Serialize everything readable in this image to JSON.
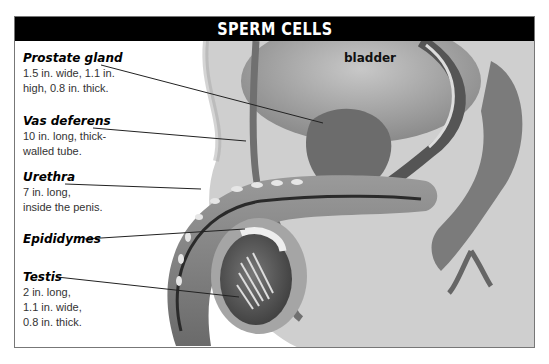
{
  "title": "SPERM CELLS",
  "organ_label": "bladder",
  "callouts": [
    {
      "name": "Prostate gland",
      "desc": "1.5 in. wide, 1.1 in.\nhigh, 0.8 in. thick."
    },
    {
      "name": "Vas deferens",
      "desc": "10 in. long, thick-\nwalled tube."
    },
    {
      "name": "Urethra",
      "desc": "7 in. long,\ninside the penis."
    },
    {
      "name": "Epididymes",
      "desc": ""
    },
    {
      "name": "Testis",
      "desc": "2 in. long,\n1.1 in. wide,\n0.8 in. thick."
    }
  ],
  "colors": {
    "title_bg": "#000000",
    "title_fg": "#ffffff",
    "tissue_bg": "#c9c9c9",
    "organ": "#8a8a8a"
  }
}
